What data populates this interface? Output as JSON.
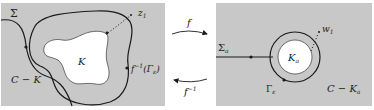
{
  "colors": {
    "panel_bg": "#c8c8c8",
    "set_fill": "#ffffff",
    "curve": "#1a1a1a",
    "text": "#222222"
  },
  "left_panel": {
    "labels": {
      "sigma": "Σ",
      "z1": "z",
      "z1_sub": "1",
      "set": "K",
      "complement": "C − K",
      "preimage": "f",
      "preimage_sup": "−1",
      "preimage_arg": "(Γ",
      "preimage_arg_sub": "ε",
      "preimage_close": ")"
    }
  },
  "arrows": {
    "forward_label": "f",
    "backward_label": "f",
    "backward_sup": "−1"
  },
  "right_panel": {
    "labels": {
      "sigma": "Σ",
      "sigma_sub": "a",
      "w1": "w",
      "w1_sub": "1",
      "set": "K",
      "set_sub": "a",
      "gamma": "Γ",
      "gamma_sub": "ε",
      "complement": "C − K",
      "complement_sub": "a"
    }
  }
}
